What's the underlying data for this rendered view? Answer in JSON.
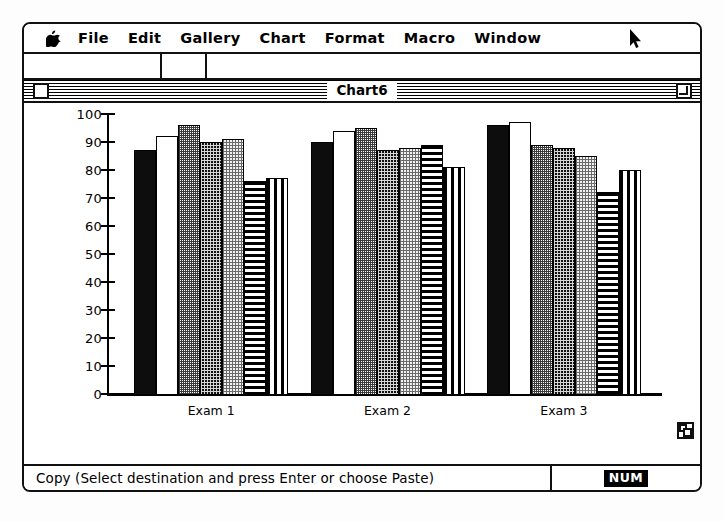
{
  "menubar": {
    "apple_icon": "apple-logo-icon",
    "items": [
      {
        "label": "File"
      },
      {
        "label": "Edit"
      },
      {
        "label": "Gallery"
      },
      {
        "label": "Chart"
      },
      {
        "label": "Format"
      },
      {
        "label": "Macro"
      },
      {
        "label": "Window"
      }
    ],
    "cursor_icon": "mouse-pointer-icon"
  },
  "window": {
    "title": "Chart6",
    "close_box_icon": "close-box-icon",
    "zoom_box_icon": "zoom-box-icon",
    "grow_box_icon": "grow-box-icon"
  },
  "statusbar": {
    "message": "Copy (Select destination and press Enter or choose Paste)",
    "num_lock": "NUM"
  },
  "chart_data": {
    "type": "bar",
    "title": "",
    "xlabel": "",
    "ylabel": "",
    "ylim": [
      0,
      100
    ],
    "yticks": [
      0,
      10,
      20,
      30,
      40,
      50,
      60,
      70,
      80,
      90,
      100
    ],
    "grid": false,
    "legend": "none",
    "categories": [
      "Exam 1",
      "Exam 2",
      "Exam 3"
    ],
    "series": [
      {
        "name": "Series 1",
        "pattern": "solid-black",
        "values": [
          87,
          90,
          96
        ]
      },
      {
        "name": "Series 2",
        "pattern": "white",
        "values": [
          92,
          94,
          97
        ]
      },
      {
        "name": "Series 3",
        "pattern": "gray-50",
        "values": [
          96,
          95,
          89
        ]
      },
      {
        "name": "Series 4",
        "pattern": "dark-dots",
        "values": [
          90,
          87,
          88
        ]
      },
      {
        "name": "Series 5",
        "pattern": "light-dots",
        "values": [
          91,
          88,
          85
        ]
      },
      {
        "name": "Series 6",
        "pattern": "horizontal-lines",
        "values": [
          76,
          89,
          72
        ]
      },
      {
        "name": "Series 7",
        "pattern": "vertical-lines",
        "values": [
          77,
          81,
          80
        ]
      }
    ]
  }
}
